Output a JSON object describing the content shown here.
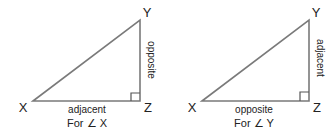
{
  "diagrams": [
    {
      "vertices": {
        "x": "X",
        "y": "Y",
        "z": "Z"
      },
      "bottom_side": "adjacent",
      "vertical_side": "opposite",
      "caption": "For ∠ X"
    },
    {
      "vertices": {
        "x": "X",
        "y": "Y",
        "z": "Z"
      },
      "bottom_side": "opposite",
      "vertical_side": "adjacent",
      "caption": "For ∠ Y"
    }
  ],
  "colors": {
    "line": "#7a7a7a",
    "text": "#222222"
  }
}
